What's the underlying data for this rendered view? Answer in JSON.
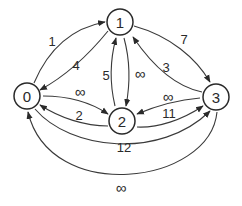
{
  "graph": {
    "type": "directed-weighted-graph",
    "nodes": [
      {
        "id": "0",
        "label": "0"
      },
      {
        "id": "1",
        "label": "1"
      },
      {
        "id": "2",
        "label": "2"
      },
      {
        "id": "3",
        "label": "3"
      }
    ],
    "edges": [
      {
        "from": "0",
        "to": "1",
        "weight": "1"
      },
      {
        "from": "1",
        "to": "0",
        "weight": "4"
      },
      {
        "from": "0",
        "to": "2",
        "weight": "∞"
      },
      {
        "from": "2",
        "to": "0",
        "weight": "2"
      },
      {
        "from": "2",
        "to": "1",
        "weight": "5"
      },
      {
        "from": "1",
        "to": "2",
        "weight": "∞"
      },
      {
        "from": "1",
        "to": "3",
        "weight": "7"
      },
      {
        "from": "3",
        "to": "1",
        "weight": "3"
      },
      {
        "from": "3",
        "to": "2",
        "weight": "∞"
      },
      {
        "from": "2",
        "to": "3",
        "weight": "11"
      },
      {
        "from": "0",
        "to": "3",
        "weight": "12"
      },
      {
        "from": "3",
        "to": "0",
        "weight": "∞"
      }
    ]
  },
  "labels": {
    "node0": "0",
    "node1": "1",
    "node2": "2",
    "node3": "3",
    "w_0_1": "1",
    "w_1_0": "4",
    "w_0_2": "∞",
    "w_2_0": "2",
    "w_2_1": "5",
    "w_1_2": "∞",
    "w_1_3": "7",
    "w_3_1": "3",
    "w_3_2": "∞",
    "w_2_3": "11",
    "w_0_3": "12",
    "w_3_0": "∞"
  },
  "colors": {
    "stroke": "#2a2a2a",
    "background": "#ffffff"
  }
}
